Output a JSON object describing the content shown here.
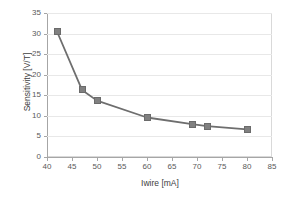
{
  "chart_data": {
    "type": "line",
    "title": "",
    "xlabel": "Iwire [mA]",
    "ylabel": "Sensitivity [V/T]",
    "xlim": [
      40,
      85
    ],
    "ylim": [
      0,
      35
    ],
    "xticks": [
      40,
      45,
      50,
      55,
      60,
      65,
      70,
      75,
      80,
      85
    ],
    "yticks": [
      0,
      5,
      10,
      15,
      20,
      25,
      30,
      35
    ],
    "grid": "horizontal",
    "legend": "none",
    "series": [
      {
        "name": "Sensitivity",
        "marker": "square",
        "color": "#808080",
        "line_color": "#6e6e6e",
        "x": [
          42,
          47,
          50,
          60,
          69,
          72,
          80
        ],
        "values": [
          30.5,
          16.3,
          13.7,
          9.6,
          8.0,
          7.5,
          6.7
        ]
      }
    ]
  },
  "axes": {
    "x_title": "Iwire [mA]",
    "y_title": "Sensitivity [V/T]",
    "x_tick_labels": [
      "40",
      "45",
      "50",
      "55",
      "60",
      "65",
      "70",
      "75",
      "80",
      "85"
    ],
    "y_tick_labels": [
      "0",
      "5",
      "10",
      "15",
      "20",
      "25",
      "30",
      "35"
    ]
  },
  "colors": {
    "marker": "#808080",
    "line": "#6e6e6e",
    "grid": "#e8e8e8",
    "axis": "#a6a6a6",
    "text": "#595959",
    "background": "#ffffff"
  }
}
